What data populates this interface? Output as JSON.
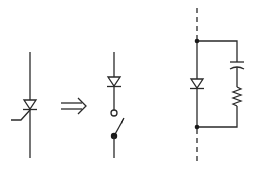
{
  "diagram": {
    "colors": {
      "stroke": "#2a2a2a",
      "background": "#ffffff"
    },
    "elements": [
      {
        "id": "thyristor",
        "type": "thyristor-symbol",
        "description": "Thyristor with gate lead"
      },
      {
        "id": "arrow",
        "type": "double-arrow",
        "glyph": "⇒",
        "description": "implies / transforms to"
      },
      {
        "id": "diode-switch",
        "type": "diode-in-series-with-switch",
        "description": "Diode followed by open switch (circle contact, lever with filled pivot)"
      },
      {
        "id": "snubber-circuit",
        "type": "diode-with-parallel-rc",
        "description": "Diode in dashed line branch with parallel series capacitor and resistor (RC snubber)"
      }
    ]
  }
}
